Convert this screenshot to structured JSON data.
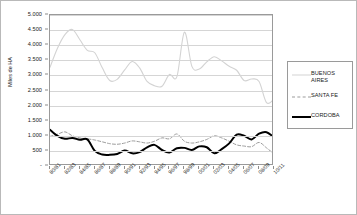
{
  "chart_data": {
    "type": "line",
    "title": "",
    "xlabel": "",
    "ylabel": "Miles de HA",
    "ylim": [
      0,
      5000
    ],
    "ytick_labels": [
      "5.000",
      "4.500",
      "4.000",
      "3.500",
      "3.000",
      "2.500",
      "2.000",
      "1.500",
      "1.000",
      "500",
      "-"
    ],
    "ytick_values": [
      5000,
      4500,
      4000,
      3500,
      3000,
      2500,
      2000,
      1500,
      1000,
      500,
      0
    ],
    "grid": true,
    "grid_axis": "y",
    "legend_position": "right",
    "categories": [
      "80/81",
      "81/82",
      "82/83",
      "83/84",
      "84/85",
      "85/86",
      "86/87",
      "87/88",
      "88/89",
      "89/90",
      "90/91",
      "91/92",
      "92/93",
      "93/94",
      "94/95",
      "95/96",
      "96/97",
      "97/98",
      "98/99",
      "99/00",
      "00/01",
      "01/02",
      "02/03",
      "03/04",
      "04/05",
      "05/06",
      "06/07",
      "07/08",
      "08/09",
      "09/10",
      "10/11"
    ],
    "xtick_labels": [
      "80/81",
      "82/83",
      "84/85",
      "86/87",
      "88/89",
      "90/91",
      "92/93",
      "94/95",
      "96/97",
      "98/99",
      "00/01",
      "02/03",
      "04/05",
      "06/07",
      "08/09",
      "10/11"
    ],
    "series": [
      {
        "name": "BUENOS AIRES",
        "color": "#d3d3d3",
        "style": "solid",
        "width": 1.1,
        "values": [
          3270,
          3900,
          4350,
          4520,
          4180,
          3830,
          3750,
          3250,
          2830,
          2870,
          3180,
          3460,
          3250,
          2800,
          2660,
          2640,
          3030,
          2960,
          4430,
          3300,
          3210,
          3450,
          3620,
          3480,
          3300,
          3170,
          2830,
          2880,
          2800,
          2100,
          2210
        ]
      },
      {
        "name": "SANTA FE",
        "color": "#9b9b9b",
        "style": "dashed",
        "width": 1.0,
        "values": [
          980,
          1050,
          1130,
          1000,
          930,
          900,
          860,
          800,
          740,
          720,
          760,
          830,
          800,
          760,
          820,
          930,
          900,
          1060,
          820,
          760,
          800,
          880,
          1000,
          930,
          820,
          700,
          660,
          640,
          780,
          600,
          400
        ]
      },
      {
        "name": "CORDOBA",
        "color": "#000000",
        "style": "solid",
        "width": 2.0,
        "values": [
          1200,
          1000,
          900,
          930,
          870,
          880,
          500,
          380,
          370,
          400,
          510,
          420,
          460,
          620,
          700,
          530,
          450,
          590,
          600,
          530,
          650,
          620,
          420,
          560,
          750,
          1040,
          1000,
          880,
          1070,
          1120,
          950
        ]
      }
    ],
    "series_extra_note": {
      "CORDOBA_tail": [
        700,
        1180,
        1090,
        600,
        150,
        430,
        480,
        460
      ],
      "SANTA_FE_tail": [
        700,
        830,
        640,
        480,
        330,
        400,
        420,
        390
      ]
    }
  },
  "legend": {
    "items": [
      {
        "label": "BUENOS AIRES",
        "swatch": "line-light-gray-solid"
      },
      {
        "label": "SANTA FE",
        "swatch": "line-gray-dashed"
      },
      {
        "label": "CORDOBA",
        "swatch": "line-black-solid"
      }
    ]
  }
}
